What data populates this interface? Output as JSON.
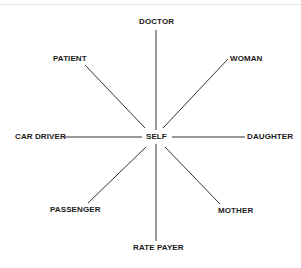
{
  "diagram": {
    "type": "radial-star",
    "center": {
      "label": "SELF"
    },
    "nodes": [
      {
        "id": "doctor",
        "label": "DOCTOR",
        "position": "top"
      },
      {
        "id": "woman",
        "label": "WOMAN",
        "position": "top-right"
      },
      {
        "id": "daughter",
        "label": "DAUGHTER",
        "position": "right"
      },
      {
        "id": "mother",
        "label": "MOTHER",
        "position": "bottom-right"
      },
      {
        "id": "rate-payer",
        "label": "RATE PAYER",
        "position": "bottom"
      },
      {
        "id": "passenger",
        "label": "PASSENGER",
        "position": "bottom-left"
      },
      {
        "id": "car-driver",
        "label": "CAR DRIVER",
        "position": "left"
      },
      {
        "id": "patient",
        "label": "PATIENT",
        "position": "top-left"
      }
    ],
    "colors": {
      "line": "#333333",
      "text": "#1a1a1a",
      "background": "#ffffff"
    }
  }
}
